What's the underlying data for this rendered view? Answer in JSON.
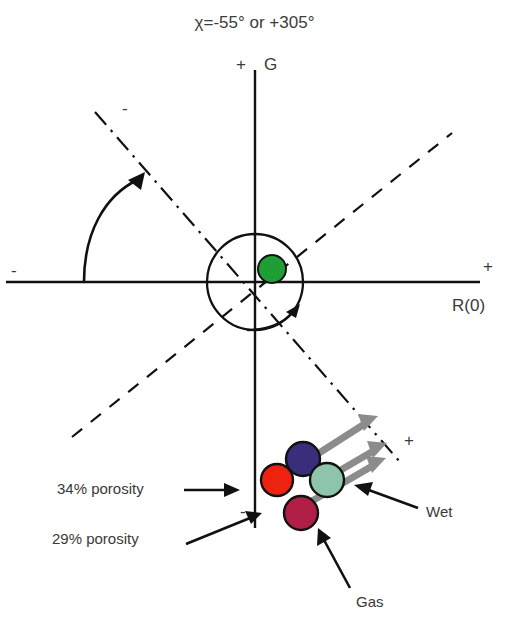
{
  "chart_data": {
    "type": "scatter",
    "title": "χ=-55° or +305°",
    "xlabel": "R(0)",
    "ylabel": "G",
    "grid": false,
    "legend_position": "none",
    "axes": {
      "x_positive_sign": "+",
      "x_negative_sign": "-",
      "y_positive_sign": "+",
      "y_negative_sign": "-",
      "rotated_axis_positive_sign": "+",
      "rotated_axis_negative_sign": "-",
      "origin": [
        255,
        282
      ],
      "x_axis_label": "R(0)",
      "y_axis_label": "G"
    },
    "rotation_angle_deg": -55,
    "rotation_angle_alt_deg": 305,
    "unit_circle_radius_px": 48,
    "series": [
      {
        "name": "origin-marker",
        "color": "#1f9e35",
        "points": [
          {
            "x": 0.35,
            "y": 0.16,
            "label": ""
          }
        ]
      },
      {
        "name": "fluid-substitution-cluster",
        "points": [
          {
            "x": 0.56,
            "y": -3.35,
            "label": "",
            "color": "#3a2d7a"
          },
          {
            "x": 0.11,
            "y": -3.95,
            "label": "",
            "color": "#ee2211"
          },
          {
            "x": 1.02,
            "y": -3.95,
            "label": "",
            "color": "#8fc4ac"
          },
          {
            "x": 0.52,
            "y": -4.62,
            "label": "",
            "color": "#b01e45"
          }
        ]
      }
    ],
    "annotations": [
      {
        "text": "34% porosity",
        "target": "red-circle"
      },
      {
        "text": "29% porosity",
        "target": "crimson-circle"
      },
      {
        "text": "Wet",
        "target": "teal-circle"
      },
      {
        "text": "Gas",
        "target": "crimson-circle"
      }
    ]
  },
  "title": {
    "text": "χ=-55° or +305°"
  },
  "axes": {
    "vertical_label": "G",
    "vertical_plus": "+",
    "vertical_minus": "-",
    "horizontal_label": "R(0)",
    "horizontal_plus": "+",
    "horizontal_minus": "-",
    "rotated_plus": "+",
    "rotated_minus": "-"
  },
  "annotations": {
    "porosity_34": "34% porosity",
    "porosity_29": "29% porosity",
    "wet": "Wet",
    "gas": "Gas"
  },
  "colors": {
    "purple_circle": "#3a2d7a",
    "red_circle": "#ee2211",
    "teal_circle": "#8fc4ac",
    "crimson_circle": "#b01e45",
    "green_circle": "#1f9e35",
    "gray_arrow": "#8c8c8c",
    "line": "#111111",
    "text": "#3a3a3a"
  },
  "icons": {
    "rotation_arrow": "rotation-arrow-icon",
    "clockwise_arrow": "clockwise-arrow-icon",
    "pointer_arrow": "pointer-arrow-icon",
    "trend_arrow": "trend-arrow-icon"
  }
}
